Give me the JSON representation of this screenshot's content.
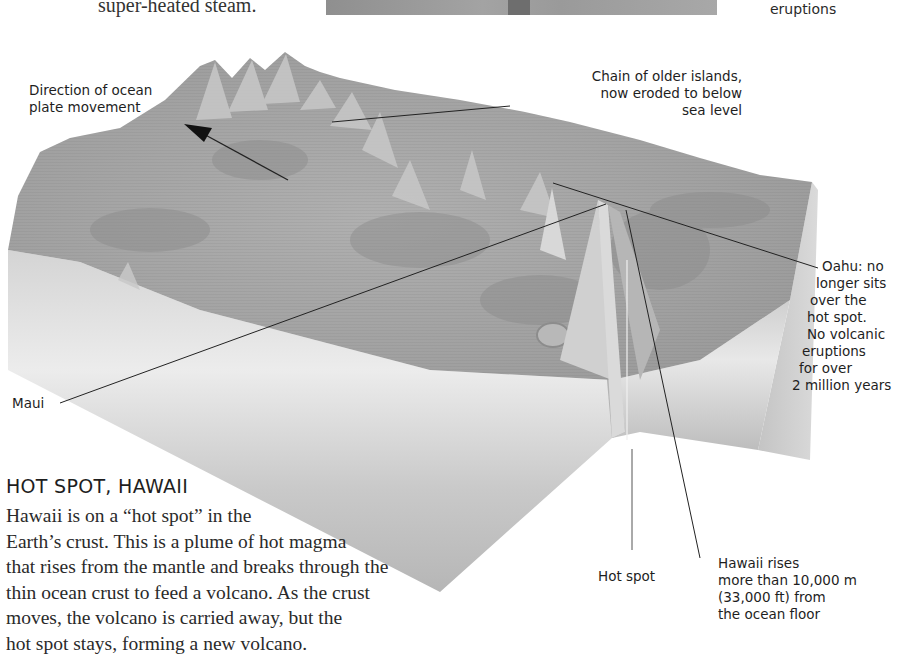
{
  "top_strip": {
    "caption_fragment": "super-heated steam.",
    "right_label_fragment": "eruptions"
  },
  "diagram": {
    "title": "HOT SPOT, HAWAII",
    "colors": {
      "terrain": "#a4a4a4",
      "terrain_dark": "#8c8c8c",
      "side_light": "#e6e6e6",
      "side_mid": "#c2c2c2",
      "leader_line": "#222222"
    },
    "labels": {
      "plate_direction": [
        "Direction of ocean",
        "plate movement"
      ],
      "older_islands": [
        "Chain of older islands,",
        "now eroded to below",
        "sea level"
      ],
      "oahu": [
        "Oahu: no",
        "longer sits",
        "over the",
        "hot spot.",
        "No volcanic",
        "eruptions",
        "for over",
        "2 million years"
      ],
      "maui": "Maui",
      "hot_spot": "Hot spot",
      "hawaii_rises": [
        "Hawaii rises",
        "more than 10,000 m",
        "(33,000 ft) from",
        "the ocean floor"
      ]
    }
  },
  "description": {
    "lines": [
      "Hawaii is on a “hot spot” in the",
      "Earth’s crust. This is a plume of hot magma",
      "that rises from the mantle and breaks through the",
      "thin ocean crust to feed a volcano. As the crust",
      "moves, the volcano is carried away, but the",
      "hot spot stays, forming a new volcano."
    ]
  }
}
